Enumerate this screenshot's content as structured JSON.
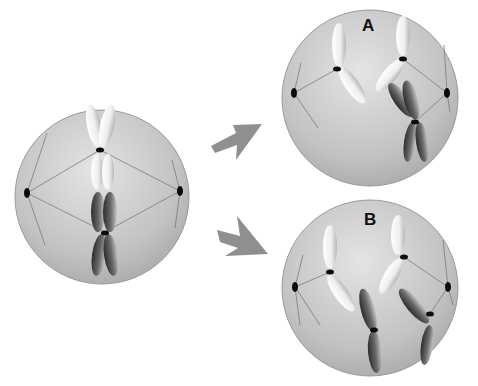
{
  "diagram": {
    "type": "cell-division",
    "cells": [
      {
        "id": "parent",
        "label": "",
        "description": "metaphase cell with two chromosome pairs aligned at center"
      },
      {
        "id": "A",
        "label": "A",
        "description": "daughter outcome A"
      },
      {
        "id": "B",
        "label": "B",
        "description": "daughter outcome B"
      }
    ],
    "arrows": [
      {
        "from": "parent",
        "to": "A"
      },
      {
        "from": "parent",
        "to": "B"
      }
    ],
    "colors": {
      "cell_fill_light": "#e2e2e2",
      "cell_fill_dark": "#a9a9a9",
      "arrow": "#8f8f8f",
      "light_chromosome": "#f4f4f4",
      "dark_chromosome": "#4a4a4a",
      "centromere": "#0a0a0a"
    }
  }
}
